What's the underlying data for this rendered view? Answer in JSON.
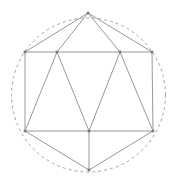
{
  "figure": {
    "background_color": "#ffffff",
    "line_color": "#8c8c8c",
    "circle_color": "#9a9a9a",
    "vertex_color": "#7a7a7a",
    "canvas": {
      "width": 179,
      "height": 183
    },
    "circumcircle": {
      "cx": 88.5,
      "cy": 95,
      "r": 77,
      "style": "dashed"
    },
    "vertices": [
      {
        "id": "apex-top",
        "label": "T",
        "x": 88,
        "y": 13
      },
      {
        "id": "upper-left",
        "label": "UL",
        "x": 25,
        "y": 52
      },
      {
        "id": "upper-mid-left",
        "label": "UML",
        "x": 57,
        "y": 52
      },
      {
        "id": "upper-mid-right",
        "label": "UMR",
        "x": 120,
        "y": 52
      },
      {
        "id": "upper-right",
        "label": "UR",
        "x": 152,
        "y": 52
      },
      {
        "id": "lower-left",
        "label": "LL",
        "x": 25,
        "y": 131
      },
      {
        "id": "lower-mid",
        "label": "LM",
        "x": 89,
        "y": 131
      },
      {
        "id": "lower-right",
        "label": "LR",
        "x": 153,
        "y": 131
      },
      {
        "id": "apex-bottom",
        "label": "B",
        "x": 89,
        "y": 170
      }
    ],
    "edges": [
      {
        "id": "e1",
        "from": "apex-top",
        "to": "upper-left"
      },
      {
        "id": "e2",
        "from": "apex-top",
        "to": "upper-mid-left"
      },
      {
        "id": "e3",
        "from": "apex-top",
        "to": "upper-mid-right"
      },
      {
        "id": "e4",
        "from": "apex-top",
        "to": "upper-right"
      },
      {
        "id": "e5",
        "from": "upper-left",
        "to": "upper-right"
      },
      {
        "id": "e6",
        "from": "upper-left",
        "to": "lower-left"
      },
      {
        "id": "e7",
        "from": "upper-right",
        "to": "lower-right"
      },
      {
        "id": "e8",
        "from": "lower-left",
        "to": "lower-right"
      },
      {
        "id": "e9",
        "from": "upper-mid-left",
        "to": "lower-left"
      },
      {
        "id": "e10",
        "from": "upper-mid-left",
        "to": "lower-mid"
      },
      {
        "id": "e11",
        "from": "upper-mid-right",
        "to": "lower-mid"
      },
      {
        "id": "e12",
        "from": "upper-mid-right",
        "to": "lower-right"
      },
      {
        "id": "e13",
        "from": "lower-left",
        "to": "apex-bottom"
      },
      {
        "id": "e14",
        "from": "lower-mid",
        "to": "apex-bottom"
      },
      {
        "id": "e15",
        "from": "lower-right",
        "to": "apex-bottom"
      }
    ]
  }
}
